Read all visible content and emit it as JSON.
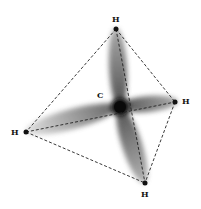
{
  "diagram": {
    "central_atom": {
      "label": "C"
    },
    "outer_atoms": [
      {
        "id": "top",
        "label": "H"
      },
      {
        "id": "right",
        "label": "H"
      },
      {
        "id": "left",
        "label": "H"
      },
      {
        "id": "bottom",
        "label": "H"
      }
    ],
    "edge_style": "dashed",
    "colors": {
      "orbital": "#555555",
      "nucleus": "#111111",
      "edge": "#222222"
    }
  }
}
